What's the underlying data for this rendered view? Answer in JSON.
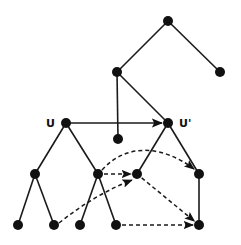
{
  "diagram": {
    "type": "tree-mapping",
    "colors": {
      "ink": "#111111",
      "background": "#ffffff"
    },
    "labels": [
      {
        "id": "label-u",
        "text": "U",
        "x": 46,
        "y": 127
      },
      {
        "id": "label-u-prime",
        "text": "U'",
        "x": 179,
        "y": 127
      }
    ],
    "nodes": [
      {
        "id": "n-root",
        "x": 168,
        "y": 21
      },
      {
        "id": "n-l1-left",
        "x": 117,
        "y": 72
      },
      {
        "id": "n-l1-right",
        "x": 220,
        "y": 72
      },
      {
        "id": "n-u",
        "x": 66,
        "y": 123
      },
      {
        "id": "n-u-prime",
        "x": 168,
        "y": 123
      },
      {
        "id": "n-mid-leaf",
        "x": 118,
        "y": 139
      },
      {
        "id": "n-u-left",
        "x": 35,
        "y": 174
      },
      {
        "id": "n-u-right",
        "x": 98,
        "y": 174
      },
      {
        "id": "n-up-left",
        "x": 137,
        "y": 174
      },
      {
        "id": "n-up-right",
        "x": 199,
        "y": 174
      },
      {
        "id": "n-leaf-1",
        "x": 18,
        "y": 225
      },
      {
        "id": "n-leaf-2",
        "x": 54,
        "y": 225
      },
      {
        "id": "n-leaf-3",
        "x": 80,
        "y": 225
      },
      {
        "id": "n-leaf-4",
        "x": 116,
        "y": 225
      },
      {
        "id": "n-up-leaf",
        "x": 199,
        "y": 225
      }
    ],
    "solid_edges": [
      [
        "n-root",
        "n-l1-left"
      ],
      [
        "n-root",
        "n-l1-right"
      ],
      [
        "n-l1-left",
        "n-mid-leaf"
      ],
      [
        "n-l1-left",
        "n-u-prime"
      ],
      [
        "n-u",
        "n-u-left"
      ],
      [
        "n-u",
        "n-u-right"
      ],
      [
        "n-u-left",
        "n-leaf-1"
      ],
      [
        "n-u-left",
        "n-leaf-2"
      ],
      [
        "n-u-right",
        "n-leaf-3"
      ],
      [
        "n-u-right",
        "n-leaf-4"
      ],
      [
        "n-u-prime",
        "n-up-left"
      ],
      [
        "n-u-prime",
        "n-up-right"
      ],
      [
        "n-up-right",
        "n-up-leaf"
      ]
    ],
    "solid_arrows": [
      [
        "n-u",
        "n-u-prime"
      ]
    ],
    "dashed_arrows": [
      {
        "from": "n-u-right",
        "to": "n-up-left",
        "curve": "straight"
      },
      {
        "from": "n-u-right",
        "to": "n-up-right",
        "curve": "arc"
      },
      {
        "from": "n-leaf-2",
        "to": "n-up-left",
        "curve": "slight"
      },
      {
        "from": "n-up-left",
        "to": "n-up-leaf",
        "curve": "straight"
      },
      {
        "from": "n-leaf-4",
        "to": "n-up-leaf",
        "curve": "straight"
      }
    ]
  }
}
